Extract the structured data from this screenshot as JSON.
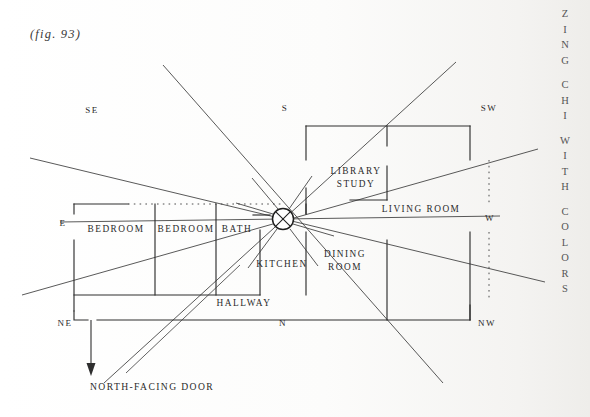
{
  "page": {
    "figure_label": "(fig. 93)",
    "cut_off_top_line": "",
    "running_head": "ZING CHI WITH COLORS",
    "running_head_words": [
      "ZING",
      "CHI",
      "WITH",
      "COLORS"
    ]
  },
  "diagram": {
    "type": "floor-plan",
    "center_marker": "circled-x",
    "compass_labels": [
      {
        "label": "SE",
        "x": 92,
        "y": 113
      },
      {
        "label": "S",
        "x": 285,
        "y": 111
      },
      {
        "label": "SW",
        "x": 489,
        "y": 111
      },
      {
        "label": "E",
        "x": 63,
        "y": 226
      },
      {
        "label": "W",
        "x": 490,
        "y": 220
      },
      {
        "label": "NE",
        "x": 65,
        "y": 325
      },
      {
        "label": "N",
        "x": 283,
        "y": 325
      },
      {
        "label": "NW",
        "x": 487,
        "y": 325
      }
    ],
    "rooms": [
      {
        "name": "BEDROOM",
        "x": 117,
        "y": 231
      },
      {
        "name": "BEDROOM",
        "x": 186,
        "y": 231
      },
      {
        "name": "BATH",
        "x": 239,
        "y": 231
      },
      {
        "name": "KITCHEN",
        "x": 281,
        "y": 266
      },
      {
        "name": "HALLWAY",
        "x": 244,
        "y": 304
      },
      {
        "name": "LIBRARY",
        "x": 356,
        "y": 173
      },
      {
        "name": "STUDY",
        "x": 356,
        "y": 186
      },
      {
        "name": "LIVING ROOM",
        "x": 421,
        "y": 211
      },
      {
        "name": "DINING ROOM_1",
        "x": 345,
        "y": 256
      },
      {
        "name": "DINING ROOM_2",
        "x": 345,
        "y": 269
      }
    ],
    "room_labels": {
      "bedroom_1": "BEDROOM",
      "bedroom_2": "BEDROOM",
      "bath": "BATH",
      "kitchen": "KITCHEN",
      "hallway": "HALLWAY",
      "library": "LIBRARY",
      "study": "STUDY",
      "living_room": "LIVING ROOM",
      "dining_line_1": "DINING",
      "dining_line_2": "ROOM"
    },
    "door_caption": "NORTH-FACING DOOR",
    "door_arrow": "down-arrow"
  },
  "colors": {
    "ink": "#2a2a2a",
    "line": "#3a3a3a",
    "paper": "#fdfdfc",
    "faded": "#d9d9d6"
  }
}
